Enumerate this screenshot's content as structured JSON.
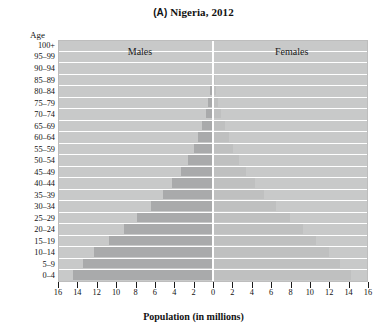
{
  "figure": {
    "panel_letter": "(A)",
    "title_text": " Nigeria, 2012",
    "full_title": "(A) Nigeria, 2012",
    "age_axis_title": "Age",
    "x_axis_title": "Population (in millions)",
    "male_label": "Males",
    "female_label": "Females",
    "colors": {
      "plot_background": "#c8c9c9",
      "male_bar": "#a9aaab",
      "female_bar": "#bfc0c0",
      "gridline": "#ffffff",
      "text": "#111111"
    }
  },
  "chart_data": {
    "type": "bar",
    "subtype": "population-pyramid",
    "title": "(A) Nigeria, 2012",
    "xlabel": "Population (in millions)",
    "ylabel": "Age",
    "xlim": [
      -16,
      16
    ],
    "xticks": [
      -16,
      -14,
      -12,
      -10,
      -8,
      -6,
      -4,
      -2,
      0,
      2,
      4,
      6,
      8,
      10,
      12,
      14,
      16
    ],
    "xticklabels": [
      "16",
      "14",
      "12",
      "10",
      "8",
      "6",
      "4",
      "2",
      "0",
      "2",
      "4",
      "6",
      "8",
      "10",
      "12",
      "14",
      "16"
    ],
    "grid": true,
    "legend": "inline-labels",
    "categories": [
      "100+",
      "95-99",
      "90-94",
      "85-89",
      "80-84",
      "75-79",
      "70-74",
      "65-69",
      "60-64",
      "55-59",
      "50-54",
      "45-49",
      "40-44",
      "35-39",
      "30-34",
      "25-29",
      "20-24",
      "15-19",
      "10-14",
      "5-9",
      "0-4"
    ],
    "series": [
      {
        "name": "Males",
        "side": "left",
        "color": "#a9aaab",
        "values": [
          0.01,
          0.03,
          0.07,
          0.15,
          0.28,
          0.48,
          0.75,
          1.1,
          1.5,
          2.0,
          2.6,
          3.3,
          4.2,
          5.2,
          6.4,
          7.8,
          9.2,
          10.7,
          12.3,
          13.4,
          14.5
        ]
      },
      {
        "name": "Females",
        "side": "right",
        "color": "#bfc0c0",
        "values": [
          0.01,
          0.04,
          0.09,
          0.18,
          0.32,
          0.54,
          0.82,
          1.2,
          1.6,
          2.1,
          2.7,
          3.4,
          4.3,
          5.3,
          6.5,
          7.9,
          9.3,
          10.6,
          12.0,
          13.1,
          14.2
        ]
      }
    ]
  }
}
